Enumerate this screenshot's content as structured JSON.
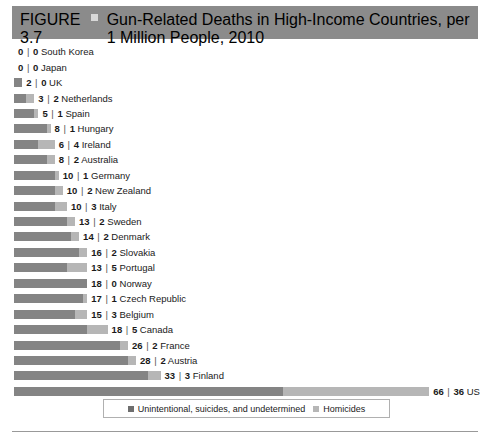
{
  "header": {
    "figure_number": "FIGURE 3.7",
    "title": "Gun-Related Deaths in High-Income Countries, per 1 Million People, 2010",
    "marker_icon": "square-marker-icon"
  },
  "legend": {
    "position": "bottom-center",
    "items": [
      {
        "label": "Unintentional, suicides, and undetermined",
        "color": "#6e6e6e"
      },
      {
        "label": "Homicides",
        "color": "#b6b6b6"
      }
    ]
  },
  "colors": {
    "header_band": "#8b8b8b",
    "primary_series": "#848484",
    "homicide_series": "#b6b6b6",
    "rule": "#999999"
  },
  "chart_data": {
    "type": "bar",
    "orientation": "horizontal",
    "stacked": true,
    "title": "Gun-Related Deaths in High-Income Countries, per 1 Million People, 2010",
    "xlabel": "",
    "ylabel": "",
    "grid": false,
    "legend_position": "bottom-center",
    "px_per_unit": 4.07,
    "categories": [
      "South Korea",
      "Japan",
      "UK",
      "Netherlands",
      "Spain",
      "Hungary",
      "Ireland",
      "Australia",
      "Germany",
      "New Zealand",
      "Italy",
      "Sweden",
      "Denmark",
      "Slovakia",
      "Portugal",
      "Norway",
      "Czech Republic",
      "Belgium",
      "Canada",
      "France",
      "Austria",
      "Finland",
      "US"
    ],
    "series": [
      {
        "name": "Unintentional, suicides, and undetermined",
        "values": [
          0,
          0,
          2,
          3,
          5,
          8,
          6,
          8,
          10,
          10,
          10,
          13,
          14,
          16,
          13,
          18,
          17,
          15,
          18,
          26,
          28,
          33,
          66
        ]
      },
      {
        "name": "Homicides",
        "values": [
          0,
          0,
          0,
          2,
          1,
          1,
          4,
          2,
          1,
          2,
          3,
          2,
          2,
          2,
          5,
          0,
          1,
          3,
          5,
          2,
          2,
          3,
          36
        ]
      }
    ],
    "rows": [
      {
        "country": "South Korea",
        "primary": 0,
        "homicides": 0
      },
      {
        "country": "Japan",
        "primary": 0,
        "homicides": 0
      },
      {
        "country": "UK",
        "primary": 2,
        "homicides": 0
      },
      {
        "country": "Netherlands",
        "primary": 3,
        "homicides": 2
      },
      {
        "country": "Spain",
        "primary": 5,
        "homicides": 1
      },
      {
        "country": "Hungary",
        "primary": 8,
        "homicides": 1
      },
      {
        "country": "Ireland",
        "primary": 6,
        "homicides": 4
      },
      {
        "country": "Australia",
        "primary": 8,
        "homicides": 2
      },
      {
        "country": "Germany",
        "primary": 10,
        "homicides": 1
      },
      {
        "country": "New Zealand",
        "primary": 10,
        "homicides": 2
      },
      {
        "country": "Italy",
        "primary": 10,
        "homicides": 3
      },
      {
        "country": "Sweden",
        "primary": 13,
        "homicides": 2
      },
      {
        "country": "Denmark",
        "primary": 14,
        "homicides": 2
      },
      {
        "country": "Slovakia",
        "primary": 16,
        "homicides": 2
      },
      {
        "country": "Portugal",
        "primary": 13,
        "homicides": 5
      },
      {
        "country": "Norway",
        "primary": 18,
        "homicides": 0
      },
      {
        "country": "Czech Republic",
        "primary": 17,
        "homicides": 1
      },
      {
        "country": "Belgium",
        "primary": 15,
        "homicides": 3
      },
      {
        "country": "Canada",
        "primary": 18,
        "homicides": 5
      },
      {
        "country": "France",
        "primary": 26,
        "homicides": 2
      },
      {
        "country": "Austria",
        "primary": 28,
        "homicides": 2
      },
      {
        "country": "Finland",
        "primary": 33,
        "homicides": 3
      },
      {
        "country": "US",
        "primary": 66,
        "homicides": 36
      }
    ]
  }
}
